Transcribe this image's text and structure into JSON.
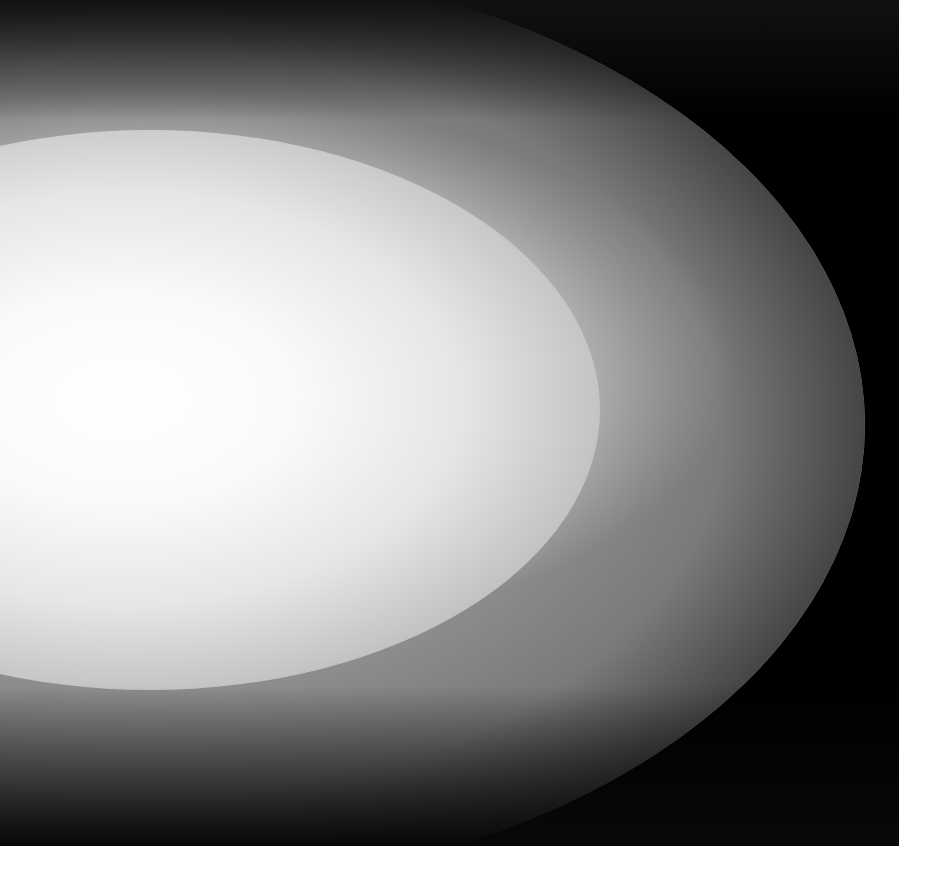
{
  "image": {
    "description": "Abstract grayscale photograph of a bright white elliptical glow fading to gray, bounded by a curved edge against a black background",
    "colors": {
      "background": "#000000",
      "highlight": "#ffffff",
      "midtone": "#7a7a7a",
      "border": "#ffffff"
    }
  }
}
